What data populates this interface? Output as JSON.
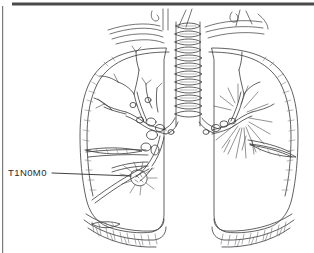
{
  "figure": {
    "domain_description": "Scanned medical textbook line drawing of anterior thorax",
    "title_alt": "Lung anatomy with staged tumor",
    "background_color": "#ffffff",
    "ink_color": "#3a3a3a",
    "ink_color_light": "#6e6e6e",
    "rule_color": "#4a4a4a"
  },
  "annotations": {
    "stage_label": "T1N0M0",
    "leader_line": {
      "from_x": 52,
      "from_y": 173,
      "to_x": 132,
      "to_y": 176
    }
  },
  "anatomy": {
    "parts": [
      "left-lung",
      "right-lung",
      "trachea",
      "vertebral-column",
      "bronchial-tree",
      "lymph-nodes",
      "diaphragm",
      "great-vessels",
      "tumor-nodule"
    ],
    "tumor": {
      "center_x": 137,
      "center_y": 177,
      "radius": 7
    }
  },
  "page_frame": {
    "top_rule_y": 3,
    "top_rule_thickness": 3,
    "top_rule_left": 12,
    "left_border_x": 2
  }
}
